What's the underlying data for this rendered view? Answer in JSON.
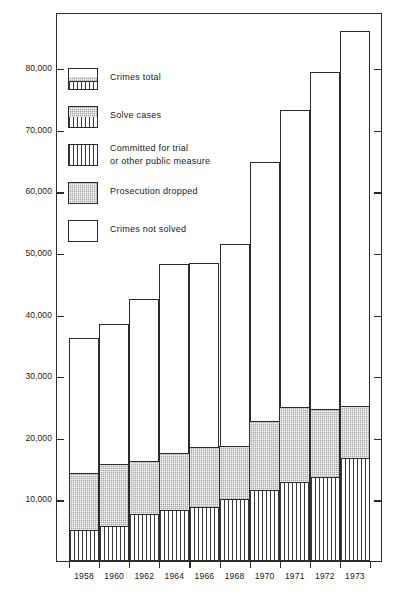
{
  "chart_data": {
    "type": "bar",
    "subtype": "stacked",
    "title": "",
    "xlabel": "",
    "ylabel": "Number of crimes",
    "ylim": [
      0,
      88000
    ],
    "grid": false,
    "legend_position": "upper-left-inside",
    "categories": [
      "1958",
      "1960",
      "1962",
      "1964",
      "1966",
      "1968",
      "1970",
      "1971",
      "1972",
      "1973"
    ],
    "y_ticks": [
      10000,
      20000,
      30000,
      40000,
      50000,
      60000,
      70000,
      80000
    ],
    "y_tick_labels": [
      "10,000",
      "20,000",
      "30,000",
      "40,000",
      "50,000",
      "60,000",
      "70,000",
      "80,000"
    ],
    "series": [
      {
        "name": "Committed for trial or other public measure",
        "pattern": "vertical-lines",
        "values": [
          5000,
          5700,
          7600,
          8300,
          8700,
          10000,
          11600,
          12800,
          13700,
          16700
        ]
      },
      {
        "name": "Prosecution dropped",
        "pattern": "grey-stipple",
        "values": [
          9300,
          10100,
          8700,
          9200,
          9800,
          8700,
          11100,
          12200,
          10900,
          8400
        ]
      },
      {
        "name": "Crimes not solved",
        "pattern": "white",
        "values": [
          22000,
          22800,
          26400,
          30900,
          30000,
          33000,
          42300,
          48300,
          54900,
          61100
        ]
      }
    ],
    "solved_totals": [
      14300,
      15800,
      16300,
      17500,
      18500,
      18700,
      22700,
      25000,
      24600,
      25100
    ],
    "totals": [
      36300,
      38600,
      42700,
      48400,
      48500,
      51700,
      65000,
      73300,
      79500,
      86200
    ]
  },
  "legend": {
    "items": [
      {
        "label": "Crimes total",
        "swatch": "stacked-total"
      },
      {
        "label": "Solve cases",
        "swatch": "solved"
      },
      {
        "label": "Committed for trial\nor other public measure",
        "swatch": "committed"
      },
      {
        "label": "Prosecution dropped",
        "swatch": "dropped"
      },
      {
        "label": "Crimes not solved",
        "swatch": "not-solved"
      }
    ]
  },
  "colors": {
    "axis": "#2b2b2b",
    "grey_fill": "#a8a8a8",
    "white_fill": "#ffffff",
    "hatch_line": "#3a3a3a"
  }
}
